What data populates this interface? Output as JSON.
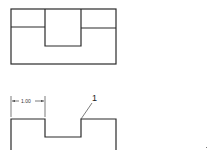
{
  "figures": {
    "top_view": {
      "description": "Rectangular block with a central rectangular notch (front view)"
    },
    "bottom_view": {
      "dimension_label": "1.00",
      "callout_label": "1"
    }
  },
  "colors": {
    "line": "#2a2a2a",
    "background": "#ffffff"
  }
}
